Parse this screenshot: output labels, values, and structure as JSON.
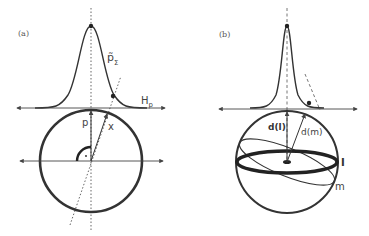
{
  "figure": {
    "panels": [
      {
        "id": "a",
        "label": "(a)",
        "annotations": {
          "density": "p̃",
          "density_sub": "Σ",
          "hyperplane": "H",
          "hyperplane_sub": "p",
          "vector_p": "p",
          "vector_x": "x"
        }
      },
      {
        "id": "b",
        "label": "(b)",
        "annotations": {
          "direction_l": "d(l)",
          "direction_m": "d(m)",
          "circle_l": "l",
          "circle_m": "m"
        }
      }
    ],
    "colors": {
      "stroke": "#333333",
      "thin_stroke": "#555555",
      "background": "#ffffff"
    }
  }
}
